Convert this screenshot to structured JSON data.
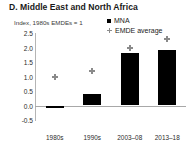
{
  "chart_data": {
    "type": "bar",
    "title": "D. Middle East and North Africa",
    "subtitle": "Index, 1980s EMDEs = 1",
    "xlabel": "",
    "ylabel": "",
    "categories": [
      "1980s",
      "1990s",
      "2003–08",
      "2013–18"
    ],
    "ylim": [
      -0.5,
      2.5
    ],
    "yticks": [
      2.5,
      2.0,
      1.5,
      1.0,
      0.5,
      0.0,
      -0.5
    ],
    "ytick_labels": [
      "2.5",
      "2.0",
      "1.5",
      "1.0",
      "0.5",
      "0.0",
      "-0.5"
    ],
    "grid": false,
    "legend_position": "top-right",
    "series": [
      {
        "name": "MNA",
        "render": "bar",
        "color": "#000000",
        "marker": "square",
        "values": [
          -0.1,
          0.4,
          1.8,
          1.9
        ]
      },
      {
        "name": "EMDE average",
        "render": "marker",
        "color": "#8a8a8a",
        "marker": "diamond-plus",
        "values": [
          1.0,
          1.2,
          2.0,
          2.3
        ]
      }
    ]
  },
  "legend": {
    "items": [
      {
        "label": "MNA",
        "swatch": "black-square-icon"
      },
      {
        "label": "EMDE average",
        "swatch": "gray-diamond-icon"
      }
    ]
  },
  "colors": {
    "series_mna": "#000000",
    "series_emde": "#8a8a8a",
    "axis": "#a8a8a8",
    "text": "#1a1a1a",
    "background": "#ffffff"
  }
}
